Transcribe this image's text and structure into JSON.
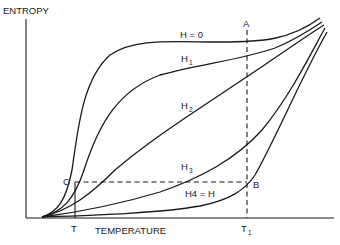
{
  "diagram": {
    "y_axis_label": "ENTROPY",
    "x_axis_label": "TEMPERATURE",
    "x_ticks": {
      "T": "T",
      "T1_base": "T",
      "T1_sub": "1"
    },
    "points": {
      "A": "A",
      "B": "B",
      "C": "C"
    },
    "curve_labels": {
      "h0": "H = 0",
      "h1_base": "H",
      "h1_sub": "1",
      "h2_base": "H",
      "h2_sub": "2",
      "h3_base": "H",
      "h3_sub": "3",
      "h4": "H4 = H"
    },
    "curves": [
      {
        "name": "H = 0",
        "shape": "steep rise near T, plateau, rise toward upper right"
      },
      {
        "name": "H1",
        "shape": "concave rise"
      },
      {
        "name": "H2",
        "shape": "near-linear rise"
      },
      {
        "name": "H3",
        "shape": "convex rise"
      },
      {
        "name": "H4 = H",
        "shape": "flat then steep rise at high temperature"
      }
    ],
    "colors": {
      "ink": "#1a1a1a",
      "background": "#ffffff"
    }
  }
}
